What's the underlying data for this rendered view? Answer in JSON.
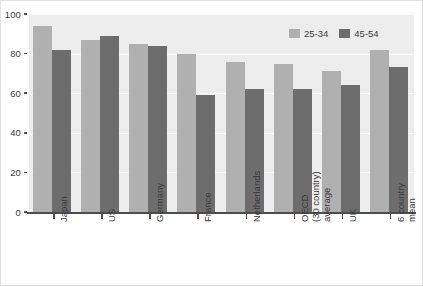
{
  "chart_data": {
    "type": "bar",
    "title": "",
    "subtitle": "",
    "xlabel": "",
    "ylabel": "",
    "ylim": [
      0,
      100
    ],
    "yticks": [
      "0",
      "20",
      "40",
      "60",
      "80",
      "100"
    ],
    "ytick_values": [
      0,
      20,
      40,
      60,
      80,
      100
    ],
    "grid": true,
    "grid_axis": "y",
    "legend_position": "top-right",
    "categories": [
      "Japan",
      "US",
      "Germany",
      "France",
      "Netherlands",
      "OECD (30 country) average",
      "UK",
      "6 country mean"
    ],
    "category_lines": [
      [
        "Japan"
      ],
      [
        "US"
      ],
      [
        "Germany"
      ],
      [
        "France"
      ],
      [
        "Netherlands"
      ],
      [
        "OECD",
        "(30 country)",
        "average"
      ],
      [
        "UK"
      ],
      [
        "6 country",
        "mean"
      ]
    ],
    "series": [
      {
        "name": "25-34",
        "color": "#b0b0b0",
        "values": [
          94,
          87,
          85,
          80,
          76,
          75,
          71,
          82
        ]
      },
      {
        "name": "45-54",
        "color": "#6d6d6d",
        "values": [
          82,
          89,
          84,
          59,
          62,
          62,
          64,
          73
        ]
      }
    ],
    "legend": [
      "25-34",
      "45-54"
    ]
  },
  "colors": {
    "plot_background": "#ededed",
    "axis": "#4d4d4d",
    "gridline": "#fbfbfb",
    "text": "#3b3b3b",
    "series_25_34": "#b0b0b0",
    "series_45_54": "#6d6d6d"
  }
}
